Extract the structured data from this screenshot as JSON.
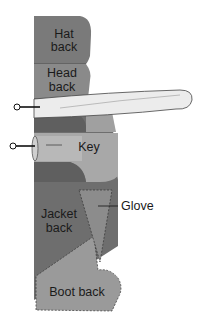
{
  "diagram": {
    "type": "sewing pattern layering diagram",
    "pieces": [
      {
        "id": "hat-back",
        "label_lines": [
          "Hat",
          "back"
        ],
        "color": "#7a7a7a"
      },
      {
        "id": "head-back",
        "label_lines": [
          "Head",
          "back"
        ],
        "color": "#8a8a8a"
      },
      {
        "id": "ribbon-loop",
        "label_lines": [],
        "color": "#e8e8e8"
      },
      {
        "id": "key",
        "label_lines": [
          "Key"
        ],
        "color": "#a8a8a8"
      },
      {
        "id": "jacket-back",
        "label_lines": [
          "Jacket",
          "back"
        ],
        "color": "#6e6e6e"
      },
      {
        "id": "glove",
        "label_lines": [
          "Glove"
        ],
        "color": "#8c8c8c"
      },
      {
        "id": "boot-back",
        "label_lines": [
          "Boot back"
        ],
        "color": "#9a9a9a"
      }
    ],
    "callouts": [
      {
        "target": "ribbon-loop",
        "marker": "open-circle-pin"
      },
      {
        "target": "key",
        "marker": "open-circle-pin"
      },
      {
        "target": "glove",
        "text": "Glove"
      }
    ]
  }
}
